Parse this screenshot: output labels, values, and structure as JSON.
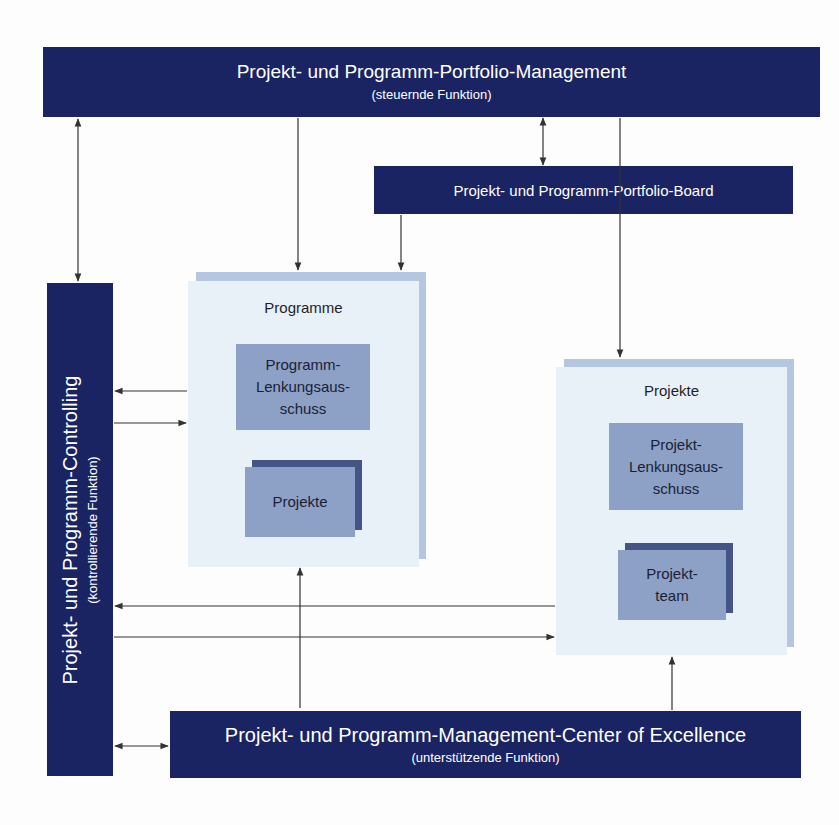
{
  "top_box": {
    "title": "Projekt- und Programm-Portfolio-Management",
    "subtitle": "(steuernde Funktion)"
  },
  "board_box": {
    "title": "Projekt- und Programm-Portfolio-Board"
  },
  "left_box": {
    "title": "Projekt- und Programm-Controlling",
    "subtitle": "(kontrollierende Funktion)"
  },
  "bottom_box": {
    "title": "Projekt- und Programm-Management-Center of Excellence",
    "subtitle": "(unterstützende Funktion)"
  },
  "programme_container": {
    "label": "Programme",
    "steering_committee": "Programm-\nLenkungsaus-\nschuss",
    "projects": "Projekte"
  },
  "projekte_container": {
    "label": "Projekte",
    "steering_committee": "Projekt-\nLenkungsaus-\nschuss",
    "team": "Projekt-\nteam"
  },
  "colors": {
    "dark_blue": "#1b2462",
    "container_bg": "#e8f0f8",
    "container_shadow": "#b4c6e0",
    "inner_box": "#8da1c6",
    "inner_shadow": "#445486",
    "arrow": "#333333"
  }
}
